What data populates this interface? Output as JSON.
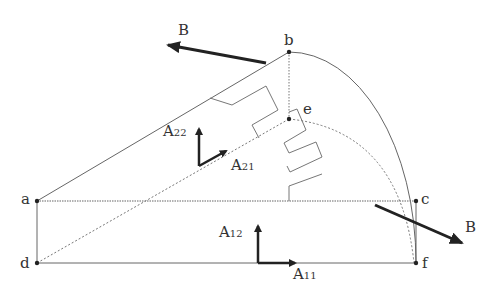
{
  "points": {
    "a": {
      "label": "a",
      "x": 37,
      "y": 201
    },
    "b": {
      "label": "b",
      "x": 289,
      "y": 52
    },
    "c": {
      "label": "c",
      "x": 416,
      "y": 201
    },
    "d": {
      "label": "d",
      "x": 37,
      "y": 263
    },
    "e": {
      "label": "e",
      "x": 289,
      "y": 119
    },
    "f": {
      "label": "f",
      "x": 416,
      "y": 263
    }
  },
  "arrows": {
    "B_top": {
      "label": "B"
    },
    "B_bottom": {
      "label": "B"
    }
  },
  "vectors": {
    "A22": {
      "base": "A",
      "sub": "22"
    },
    "A21": {
      "base": "A",
      "sub": "21"
    },
    "A12": {
      "base": "A",
      "sub": "12"
    },
    "A11": {
      "base": "A",
      "sub": "11"
    }
  },
  "colors": {
    "line": "#555555",
    "arrow": "#222222",
    "text": "#333333"
  }
}
